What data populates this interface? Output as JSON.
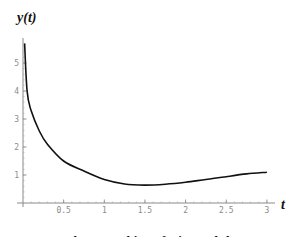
{
  "chart_data": {
    "type": "line",
    "title_parts": [
      "The Wronskian of",
      "sin",
      "and",
      "log"
    ],
    "xlabel": "t",
    "ylabel": "y(t)",
    "xlim": [
      0,
      3.1
    ],
    "ylim": [
      0,
      5.8
    ],
    "grid": false,
    "legend": "none",
    "x_ticks": [
      0.5,
      1,
      1.5,
      2,
      2.5,
      3
    ],
    "x_tick_labels": [
      "0.5",
      "1",
      "1.5",
      "2",
      "2.5",
      "3"
    ],
    "y_ticks": [
      1,
      2,
      3,
      4,
      5
    ],
    "y_tick_labels": [
      "1",
      "2",
      "3",
      "4",
      "5"
    ],
    "series": [
      {
        "name": "W(sin, log)",
        "x": [
          0.02,
          0.05,
          0.1,
          0.2,
          0.3,
          0.5,
          0.75,
          1.0,
          1.25,
          1.5,
          1.75,
          2.0,
          2.25,
          2.5,
          2.75,
          3.0
        ],
        "values": [
          5.7,
          4.0,
          3.3,
          2.57,
          2.1,
          1.5,
          1.14,
          0.84,
          0.68,
          0.64,
          0.67,
          0.74,
          0.84,
          0.94,
          1.04,
          1.1
        ]
      }
    ]
  }
}
